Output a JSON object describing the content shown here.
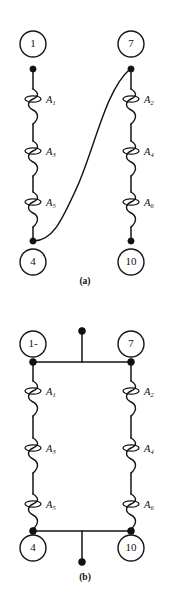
{
  "figure": {
    "background_color": "#ffffff",
    "line_color": "#151515",
    "panels": [
      {
        "id": "a",
        "caption": "(a)",
        "description": "Two coil branches in series, joined by a curved jumper from node 4 terminal to node 7 terminal",
        "nodes": [
          {
            "name": "node-1",
            "label": "1",
            "position": "top-left"
          },
          {
            "name": "node-7",
            "label": "7",
            "position": "top-right"
          },
          {
            "name": "node-4",
            "label": "4",
            "position": "bottom-left"
          },
          {
            "name": "node-10",
            "label": "10",
            "position": "bottom-right"
          }
        ],
        "coils": [
          {
            "name": "coil-a1",
            "label": "A",
            "subscript": "1",
            "branch": "left",
            "order": 1
          },
          {
            "name": "coil-a3",
            "label": "A",
            "subscript": "3",
            "branch": "left",
            "order": 2
          },
          {
            "name": "coil-a5",
            "label": "A",
            "subscript": "5",
            "branch": "left",
            "order": 3
          },
          {
            "name": "coil-a2",
            "label": "A",
            "subscript": "2",
            "branch": "right",
            "order": 1
          },
          {
            "name": "coil-a4",
            "label": "A",
            "subscript": "4",
            "branch": "right",
            "order": 2
          },
          {
            "name": "coil-a6",
            "label": "A",
            "subscript": "6",
            "branch": "right",
            "order": 3
          }
        ],
        "jumper": "curved connection from bottom-left terminal to top-right terminal"
      },
      {
        "id": "b",
        "caption": "(b)",
        "description": "Two coil branches in parallel with common top and bottom bus bars and center tap leads",
        "nodes": [
          {
            "name": "node-1",
            "label": "1-",
            "position": "top-left"
          },
          {
            "name": "node-7",
            "label": "7",
            "position": "top-right"
          },
          {
            "name": "node-4",
            "label": "4",
            "position": "bottom-left"
          },
          {
            "name": "node-10",
            "label": "10",
            "position": "bottom-right"
          }
        ],
        "coils": [
          {
            "name": "coil-a1",
            "label": "A",
            "subscript": "1",
            "branch": "left",
            "order": 1
          },
          {
            "name": "coil-a3",
            "label": "A",
            "subscript": "3",
            "branch": "left",
            "order": 2
          },
          {
            "name": "coil-a5",
            "label": "A",
            "subscript": "5",
            "branch": "left",
            "order": 3
          },
          {
            "name": "coil-a2",
            "label": "A",
            "subscript": "2",
            "branch": "right",
            "order": 1
          },
          {
            "name": "coil-a4",
            "label": "A",
            "subscript": "4",
            "branch": "right",
            "order": 2
          },
          {
            "name": "coil-a6",
            "label": "A",
            "subscript": "6",
            "branch": "right",
            "order": 3
          }
        ],
        "leads": [
          {
            "name": "top-center-lead",
            "position": "top"
          },
          {
            "name": "bottom-center-lead",
            "position": "bottom"
          }
        ]
      }
    ]
  }
}
